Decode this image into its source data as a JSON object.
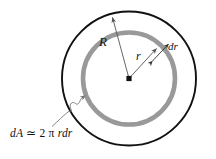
{
  "figure": {
    "background_color": "#ffffff",
    "canvas": {
      "width": 216,
      "height": 159
    }
  },
  "geometry": {
    "center": {
      "x": 129,
      "y": 78.5
    },
    "outer_circle": {
      "radius": 67,
      "stroke_color": "#111111",
      "stroke_width": 1.9,
      "fill": "none"
    },
    "ring_circle": {
      "radius": 46,
      "stroke_color": "#999999",
      "stroke_width": 4.6,
      "fill": "none"
    },
    "center_dot": {
      "size": 5,
      "color": "#111111",
      "shape": "square"
    }
  },
  "labels": {
    "outer_radius": "R",
    "ring_radius": "r",
    "ring_thickness": "dr",
    "area_element_prefix": "dA",
    "area_element_relation": "≃",
    "area_element_coefficient": "2",
    "area_element_pi": "π",
    "area_element_suffix": "rdr",
    "area_element_full": "dA ≃ 2 π rdr"
  },
  "annotations": {
    "R_arrow": {
      "name": "radius-R-arrow",
      "from": {
        "x": 129,
        "y": 78.5
      },
      "to": {
        "x": 111,
        "y": 14
      },
      "arrowhead": "at-outer-circle",
      "stroke_color": "#555555"
    },
    "r_arrow": {
      "name": "radius-r-arrow",
      "from": {
        "x": 129,
        "y": 78.5
      },
      "to": {
        "x": 158,
        "y": 46
      },
      "arrowhead": "at-ring",
      "stroke_color": "#555555"
    },
    "dr_arrow": {
      "name": "thickness-dr-double-arrow",
      "from": {
        "x": 151,
        "y": 60
      },
      "to": {
        "x": 170,
        "y": 41
      },
      "arrowhead": "double",
      "stroke_color": "#333333"
    },
    "dA_leader": {
      "name": "area-element-squiggly-leader",
      "start": {
        "x": 54,
        "y": 127
      },
      "end": {
        "x": 86,
        "y": 96
      },
      "style": "wavy",
      "arrowhead": "at-ring",
      "stroke_color": "#777777"
    }
  }
}
